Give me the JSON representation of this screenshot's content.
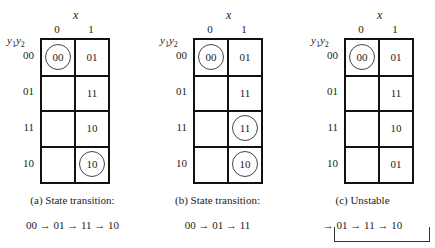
{
  "axis": {
    "x_label": "x",
    "col_labels": [
      "0",
      "1"
    ],
    "row_header": "y1y2",
    "row_labels": [
      "00",
      "01",
      "11",
      "10"
    ]
  },
  "panels": [
    {
      "id": "a",
      "cells": [
        [
          "00",
          "01"
        ],
        [
          "",
          "11"
        ],
        [
          "",
          "10"
        ],
        [
          "",
          "10"
        ]
      ],
      "circled": [
        [
          0,
          0
        ],
        [
          3,
          1
        ]
      ],
      "caption": "(a)  State transition:",
      "sequence": "00 → 01 → 11 → 10"
    },
    {
      "id": "b",
      "cells": [
        [
          "00",
          "01"
        ],
        [
          "",
          "11"
        ],
        [
          "",
          "11"
        ],
        [
          "",
          "10"
        ]
      ],
      "circled": [
        [
          0,
          0
        ],
        [
          2,
          1
        ],
        [
          3,
          1
        ]
      ],
      "caption": "(b)  State transition:",
      "sequence": "00 → 01 → 11"
    },
    {
      "id": "c",
      "cells": [
        [
          "00",
          "01"
        ],
        [
          "",
          "11"
        ],
        [
          "",
          "10"
        ],
        [
          "",
          "01"
        ]
      ],
      "circled": [
        [
          0,
          0
        ]
      ],
      "caption": "(c)  Unstable",
      "sequence": "→ 01 → 11 → 10"
    }
  ]
}
